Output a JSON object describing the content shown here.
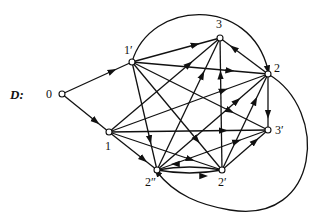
{
  "title": "D:",
  "nodes": [
    {
      "id": "0",
      "label": "0",
      "x": 62,
      "y": 94,
      "lx": 46,
      "ly": 98
    },
    {
      "id": "1p",
      "label": "1′",
      "x": 132,
      "y": 62,
      "lx": 124,
      "ly": 54
    },
    {
      "id": "3",
      "label": "3",
      "x": 220,
      "y": 38,
      "lx": 216,
      "ly": 28
    },
    {
      "id": "2",
      "label": "2",
      "x": 268,
      "y": 74,
      "lx": 274,
      "ly": 72
    },
    {
      "id": "1",
      "label": "1",
      "x": 109,
      "y": 132,
      "lx": 105,
      "ly": 150
    },
    {
      "id": "3p",
      "label": "3′",
      "x": 268,
      "y": 130,
      "lx": 275,
      "ly": 134
    },
    {
      "id": "2pp",
      "label": "2″",
      "x": 157,
      "y": 170,
      "lx": 145,
      "ly": 186
    },
    {
      "id": "2p",
      "label": "2′",
      "x": 222,
      "y": 170,
      "lx": 218,
      "ly": 186
    }
  ],
  "edges": [
    {
      "from": "0",
      "to": "1p"
    },
    {
      "from": "0",
      "to": "1"
    },
    {
      "from": "1p",
      "to": "3"
    },
    {
      "from": "1p",
      "to": "2"
    },
    {
      "from": "1p",
      "to": "3p"
    },
    {
      "from": "1p",
      "to": "2pp"
    },
    {
      "from": "1p",
      "to": "2p"
    },
    {
      "from": "1",
      "to": "3"
    },
    {
      "from": "1",
      "to": "2"
    },
    {
      "from": "1",
      "to": "3p"
    },
    {
      "from": "1",
      "to": "2pp"
    },
    {
      "from": "1",
      "to": "2p"
    },
    {
      "from": "2pp",
      "to": "3"
    },
    {
      "from": "2pp",
      "to": "2"
    },
    {
      "from": "2pp",
      "to": "3p"
    },
    {
      "from": "2p",
      "to": "3"
    },
    {
      "from": "2p",
      "to": "2"
    },
    {
      "from": "2p",
      "to": "3p"
    },
    {
      "from": "2",
      "to": "3"
    },
    {
      "from": "2",
      "to": "3p"
    },
    {
      "from": "2pp",
      "to": "2p",
      "curve": 6
    },
    {
      "from": "2p",
      "to": "2pp",
      "curve": 6
    }
  ],
  "arcs": [
    {
      "name": "arc-1p-to-2",
      "d": "M132,62 C150,0 250,-5 268,70"
    },
    {
      "name": "arc-2-to-2pp",
      "d": "M268,74 C330,110 320,225 230,210 C200,205 175,195 157,172"
    }
  ]
}
